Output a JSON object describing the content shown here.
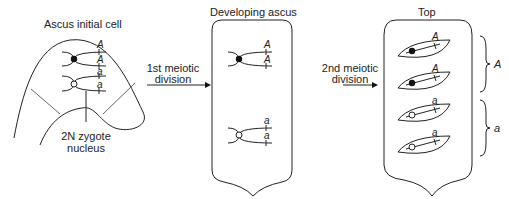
{
  "panels": {
    "initial": {
      "title": "Ascus initial cell",
      "nucleus_label_line1": "2N zygote",
      "nucleus_label_line2": "nucleus",
      "genes": [
        "A",
        "A",
        "a",
        "a"
      ]
    },
    "arrow1": {
      "line1": "1st meiotic",
      "line2": "division"
    },
    "developing": {
      "title": "Developing ascus",
      "genes_top": [
        "A",
        "A"
      ],
      "genes_bottom": [
        "a",
        "a"
      ]
    },
    "arrow2": {
      "line1": "2nd meiotic",
      "line2": "division"
    },
    "final": {
      "title": "Top",
      "spore_genes": [
        "A",
        "A",
        "a",
        "a"
      ],
      "bracket_labels": [
        "A",
        "a"
      ]
    }
  }
}
